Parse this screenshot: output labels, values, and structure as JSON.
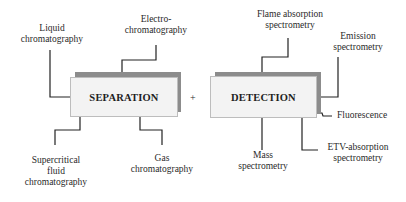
{
  "separation": {
    "title": "SEPARATION",
    "techniques": {
      "liquid": [
        "Liquid",
        "chromatography"
      ],
      "electro": [
        "Electro-",
        "chromatography"
      ],
      "supercritical": [
        "Supercritical",
        "fluid",
        "chromatography"
      ],
      "gas": [
        "Gas",
        "chromatography"
      ]
    }
  },
  "operator": "+",
  "detection": {
    "title": "DETECTION",
    "techniques": {
      "flame": [
        "Flame absorption",
        "spectrometry"
      ],
      "emission": [
        "Emission",
        "spectrometry"
      ],
      "fluorescence": [
        "Fluorescence"
      ],
      "mass": [
        "Mass",
        "spectrometry"
      ],
      "etv": [
        "ETV-absorption",
        "spectrometry"
      ]
    }
  },
  "colors": {
    "line": "#222222",
    "box_fill": "#f3f3f3",
    "box_shadow": "#8c8c8c"
  }
}
